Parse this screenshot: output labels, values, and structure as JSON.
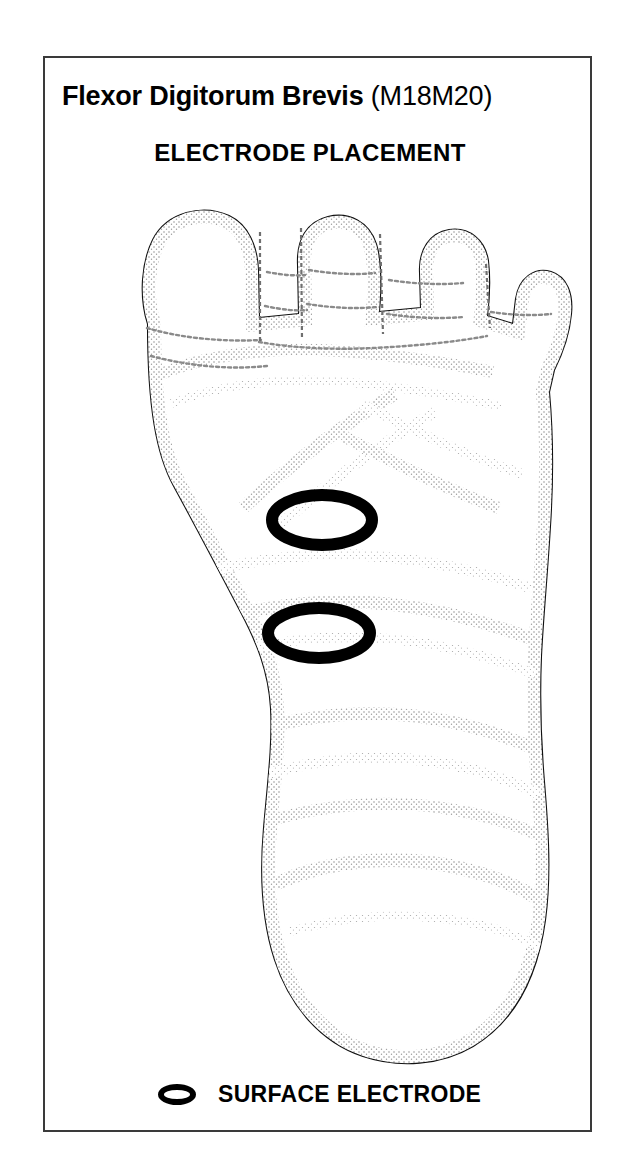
{
  "figure": {
    "title_muscle": "Flexor Digitorum Brevis",
    "title_code": "(M18M20)",
    "subtitle": "ELECTRODE PLACEMENT",
    "view": "plantar-view-of-foot",
    "colors": {
      "ink": "#000000",
      "frame": "#3a3a3a",
      "stipple": "#8d8d8d",
      "background": "#ffffff"
    }
  },
  "legend": {
    "marker_icon": "surface-electrode-ring-icon",
    "label": "SURFACE ELECTRODE"
  },
  "electrodes": [
    {
      "id": "proximal-electrode",
      "cx": 322,
      "cy": 520,
      "rx": 50,
      "ry": 25
    },
    {
      "id": "distal-electrode",
      "cx": 319,
      "cy": 633,
      "rx": 51,
      "ry": 25
    }
  ]
}
